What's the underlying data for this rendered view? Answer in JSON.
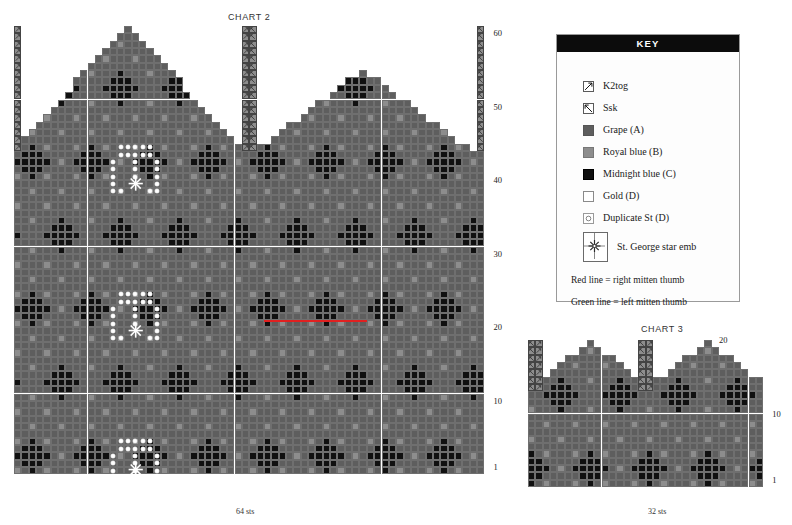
{
  "charts": [
    {
      "id": "chart2",
      "title": "CHART 2",
      "sts_label": "64 sts",
      "stitches": 64,
      "rows": 61,
      "row_numbers": [
        1,
        10,
        20,
        30,
        40,
        50,
        60
      ]
    },
    {
      "id": "chart3",
      "title": "CHART 3",
      "sts_label": "32 sts",
      "stitches": 32,
      "rows": 20,
      "row_numbers": [
        1,
        10,
        20
      ]
    }
  ],
  "key": {
    "header": "KEY",
    "items": [
      {
        "icon": "k2tog-symbol-icon",
        "label": "K2tog",
        "swatch": "dec-left"
      },
      {
        "icon": "ssk-symbol-icon",
        "label": "Ssk",
        "swatch": "dec-right"
      },
      {
        "icon": "grape-swatch-icon",
        "label": "Grape (A)",
        "swatch": "A",
        "color": "#5e5e5e"
      },
      {
        "icon": "royal-blue-swatch-icon",
        "label": "Royal blue (B)",
        "swatch": "B",
        "color": "#8d8d8d"
      },
      {
        "icon": "midnight-blue-swatch-icon",
        "label": "Midnight blue (C)",
        "swatch": "C",
        "color": "#101010"
      },
      {
        "icon": "gold-swatch-icon",
        "label": "Gold (D)",
        "swatch": "D",
        "color": "#ffffff"
      },
      {
        "icon": "duplicate-stitch-icon",
        "label": "Duplicate St (D)",
        "swatch": "dup"
      },
      {
        "icon": "st-george-star-icon",
        "label": "St. George star emb",
        "swatch": "star"
      }
    ],
    "notes": [
      {
        "icon": "red-line-note",
        "label": "Red line = right mitten thumb",
        "color": "#e02020"
      },
      {
        "icon": "green-line-note",
        "label": "Green line = left mitten thumb",
        "color": "#1aa02a"
      }
    ]
  },
  "colors": {
    "grape_A": "#5e5e5e",
    "royal_blue_B": "#8d8d8d",
    "midnight_blue_C": "#101010",
    "gold_D": "#ffffff",
    "grid_line": "#6f6f6f",
    "red_thumb_line": "#e02020",
    "green_thumb_line": "#1aa02a"
  },
  "chart_data": {
    "type": "heatmap",
    "xlabel": "stitches",
    "ylabel": "rows",
    "palette": {
      "A": "#5e5e5e",
      "B": "#8d8d8d",
      "C": "#101010",
      "D": "#ffffff"
    },
    "chart2": {
      "title": "CHART 2",
      "stitches": 64,
      "rows": 61,
      "sts_label": "64 sts",
      "row_tick_labels": [
        1,
        10,
        20,
        30,
        40,
        50,
        60
      ],
      "peaks": [
        {
          "apex_stitch": 16,
          "apex_row": 61
        },
        {
          "apex_stitch": 48,
          "apex_row": 55
        }
      ],
      "decrease_columns": [
        {
          "stitch": 1,
          "symbol": "K2tog",
          "from_row": 44,
          "to_row": 61
        },
        {
          "stitch": 32,
          "symbol": "K2tog",
          "from_row": 46,
          "to_row": 61
        },
        {
          "stitch": 33,
          "symbol": "Ssk",
          "from_row": 46,
          "to_row": 61
        },
        {
          "stitch": 64,
          "symbol": "Ssk",
          "from_row": 44,
          "to_row": 61
        }
      ],
      "motifs": [
        {
          "name": "crown-arch-duplicate-stitch",
          "center_stitch": 17,
          "base_row": 46
        },
        {
          "name": "crown-arch-duplicate-stitch",
          "center_stitch": 17,
          "base_row": 26
        },
        {
          "name": "crown-arch-duplicate-stitch",
          "center_stitch": 17,
          "base_row": 6
        },
        {
          "name": "st-george-star-emb",
          "stitch": 17,
          "row": 45
        },
        {
          "name": "st-george-star-emb",
          "stitch": 17,
          "row": 25
        },
        {
          "name": "st-george-star-emb",
          "stitch": 17,
          "row": 5
        }
      ],
      "thumb_lines": [
        {
          "name": "right-mitten-thumb",
          "color": "#e02020",
          "row": 21,
          "from_stitch": 35,
          "to_stitch": 48
        }
      ]
    },
    "chart3": {
      "title": "CHART 3",
      "stitches": 32,
      "rows": 20,
      "sts_label": "32 sts",
      "row_tick_labels": [
        1,
        10,
        20
      ],
      "peaks": [
        {
          "apex_stitch": 9,
          "apex_row": 20
        },
        {
          "apex_stitch": 25,
          "apex_row": 20
        }
      ],
      "decrease_columns": [
        {
          "stitch": 1,
          "symbol": "Ssk",
          "from_row": 14,
          "to_row": 20
        },
        {
          "stitch": 2,
          "symbol": "K2tog",
          "from_row": 14,
          "to_row": 20
        },
        {
          "stitch": 16,
          "symbol": "Ssk",
          "from_row": 14,
          "to_row": 20
        },
        {
          "stitch": 17,
          "symbol": "K2tog",
          "from_row": 14,
          "to_row": 20
        }
      ]
    }
  }
}
